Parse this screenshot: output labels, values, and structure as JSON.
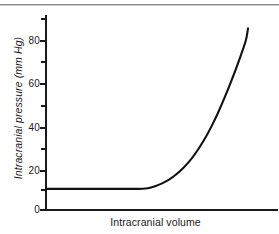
{
  "chart_data": {
    "type": "line",
    "title": "",
    "xlabel": "Intracranial volume",
    "ylabel": "Intracranial pressure (mm Hg)",
    "xlim": [
      0,
      100
    ],
    "ylim": [
      0,
      90
    ],
    "grid": false,
    "legend_position": "none",
    "y_ticks_major": [
      0,
      20,
      40,
      60,
      80
    ],
    "y_ticks_minor": [
      10,
      30,
      50,
      70,
      90
    ],
    "y_tick_labels": [
      "0",
      "20",
      "40",
      "60",
      "80"
    ],
    "x_ticks": [],
    "x_tick_labels": [],
    "series": [
      {
        "name": "Intracranial pressure-volume curve",
        "color": "#111111",
        "x": [
          0,
          5,
          10,
          15,
          20,
          25,
          30,
          35,
          40,
          43,
          45,
          47,
          50,
          53,
          56,
          59,
          62,
          65,
          68,
          71,
          74,
          77,
          80,
          83,
          86,
          87
        ],
        "y": [
          10,
          10,
          10,
          10,
          10,
          10,
          10,
          10,
          10,
          10.2,
          10.6,
          11.2,
          12.6,
          14.4,
          16.8,
          19.8,
          23.4,
          27.8,
          33.0,
          39.0,
          45.8,
          53.4,
          61.6,
          70.4,
          80.0,
          86.0
        ]
      }
    ],
    "annotations": []
  },
  "axis": {
    "y_label": "Intracranial pressure (mm Hg)",
    "x_label": "Intracranial volume",
    "tick_labels": {
      "t80": "80",
      "t60": "60",
      "t40": "40",
      "t20": "20",
      "t0": "0"
    }
  },
  "colors": {
    "curve": "#111111",
    "axis": "#1a1a1a",
    "rule": "#8d8d8d",
    "background": "#ffffff"
  }
}
